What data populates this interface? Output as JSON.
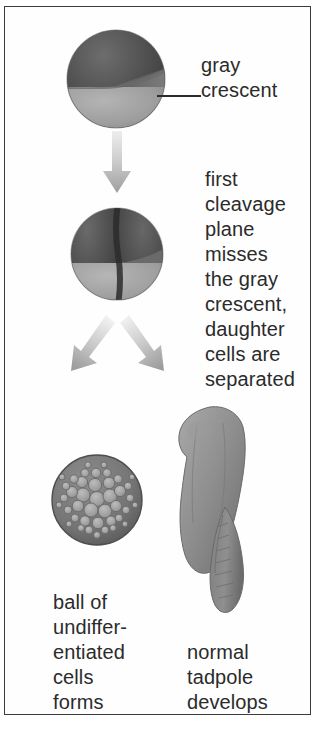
{
  "figure": {
    "background_color": "#ffffff",
    "border_color": "#3b3b3b",
    "text_color": "#2b2b2b"
  },
  "labels": {
    "gray_crescent": "gray\ncrescent",
    "first_cleavage": "first\ncleavage\nplane\nmisses\nthe gray\ncrescent,\ndaughter\ncells are\nseparated",
    "ball_of_cells": "ball of\nundiffer-\nentiated\ncells\nforms",
    "normal_tadpole": "normal\ntadpole\ndevelops"
  },
  "stages": {
    "zygote": {
      "name": "fertilized egg with gray crescent",
      "animal_pole_color": "#4a4a4a",
      "vegetal_pole_color": "#9a9a9a",
      "crescent_color": "#6e6e6e"
    },
    "two_cell": {
      "name": "two-cell embryo with vertical cleavage furrow",
      "animal_pole_color": "#4a4a4a",
      "vegetal_pole_color": "#9a9a9a",
      "furrow_color": "#2e2e2e"
    },
    "blastula": {
      "name": "ball of undifferentiated cells",
      "rim_color": "#6b6b6b",
      "cell_color": "#a8a8a8"
    },
    "tadpole": {
      "name": "normal tadpole",
      "body_color": "#8e8e8e",
      "shadow_color": "#6f6f6f"
    }
  },
  "arrows": {
    "down": "downward-arrow",
    "down_left": "down-left-arrow",
    "down_right": "down-right-arrow",
    "color_light": "#e2e2e2",
    "color_dark": "#9b9b9b"
  }
}
